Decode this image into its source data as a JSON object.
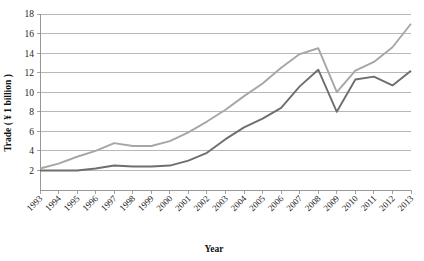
{
  "chart_data": {
    "type": "line",
    "title": "",
    "xlabel": "Year",
    "ylabel": "Trade ( ¥ 1 billion )",
    "categories": [
      "1993",
      "1994",
      "1995",
      "1996",
      "1997",
      "1998",
      "1999",
      "2000",
      "2001",
      "2002",
      "2003",
      "2004",
      "2005",
      "2006",
      "2007",
      "2008",
      "2009",
      "2010",
      "2011",
      "2012",
      "2013"
    ],
    "ylim": [
      0,
      18
    ],
    "yticks": [
      2,
      4,
      6,
      8,
      10,
      12,
      14,
      16,
      18
    ],
    "grid": true,
    "legend": "none",
    "series": [
      {
        "name": "series-light",
        "color": "#a6a6a6",
        "values": [
          2.2,
          2.7,
          3.4,
          4.0,
          4.8,
          4.5,
          4.5,
          5.0,
          5.9,
          7.0,
          8.2,
          9.6,
          10.9,
          12.5,
          13.9,
          14.5,
          10.0,
          12.2,
          13.1,
          14.6,
          17.0
        ]
      },
      {
        "name": "series-dark",
        "color": "#6e6e6e",
        "values": [
          2.0,
          2.0,
          2.0,
          2.2,
          2.5,
          2.4,
          2.4,
          2.5,
          3.0,
          3.8,
          5.2,
          6.4,
          7.3,
          8.4,
          10.6,
          12.3,
          8.0,
          11.3,
          11.6,
          10.7,
          12.2
        ]
      }
    ]
  }
}
